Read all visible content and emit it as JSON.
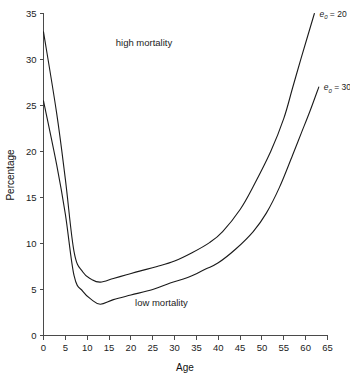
{
  "chart_data": {
    "type": "line",
    "title": "",
    "xlabel": "Age",
    "ylabel": "Percentage",
    "xlim": [
      0,
      65
    ],
    "ylim": [
      0,
      35
    ],
    "xticks": [
      0,
      5,
      10,
      15,
      20,
      25,
      30,
      35,
      40,
      45,
      50,
      55,
      60,
      65
    ],
    "xtick_labels": [
      "0",
      "5",
      "10",
      "15",
      "20",
      "25",
      "30",
      "35",
      "40",
      "45",
      "50",
      "55",
      "60",
      "65"
    ],
    "yticks": [
      0,
      5,
      10,
      15,
      20,
      25,
      30,
      35
    ],
    "ytick_labels": [
      "0",
      "5",
      "10",
      "15",
      "20",
      "25",
      "30",
      "35"
    ],
    "grid": false,
    "legend_position": "inline-right-end",
    "annotations": [
      {
        "text": "high mortality",
        "x": 23,
        "y": 31.5
      },
      {
        "text": "low mortality",
        "x": 27,
        "y": 3.2
      }
    ],
    "series": [
      {
        "name": "e0 = 20",
        "label_prefix": "e",
        "label_subscript": "0",
        "label_suffix": " = 20",
        "color": "#1a1a1a",
        "end_label_x": 62,
        "end_label_y": 35,
        "x": [
          0,
          3,
          5,
          7,
          9,
          11,
          13,
          16,
          19,
          22,
          26,
          30,
          34,
          38,
          41,
          45,
          48,
          52,
          55,
          57,
          59,
          62
        ],
        "y": [
          33.0,
          24.2,
          17.0,
          9.1,
          6.9,
          6.1,
          5.8,
          6.2,
          6.6,
          7.0,
          7.5,
          8.1,
          9.0,
          10.1,
          11.3,
          13.7,
          16.2,
          20.0,
          23.6,
          26.9,
          30.2,
          35.0
        ]
      },
      {
        "name": "e0 = 30",
        "label_prefix": "e",
        "label_subscript": "0",
        "label_suffix": " = 30",
        "color": "#1a1a1a",
        "end_label_x": 63,
        "end_label_y": 27,
        "x": [
          0,
          3,
          5,
          7,
          9,
          11,
          13,
          16,
          20,
          25,
          29,
          33,
          37,
          40,
          44,
          48,
          51,
          54,
          57,
          59,
          61,
          63
        ],
        "y": [
          25.5,
          18.6,
          13.2,
          6.5,
          4.8,
          3.9,
          3.4,
          3.9,
          4.4,
          5.0,
          5.7,
          6.3,
          7.2,
          7.9,
          9.4,
          11.3,
          13.3,
          16.1,
          19.6,
          22.0,
          24.4,
          27.0
        ]
      }
    ]
  },
  "labels": {
    "x_axis_title": "Age",
    "y_axis_title": "Percentage"
  }
}
